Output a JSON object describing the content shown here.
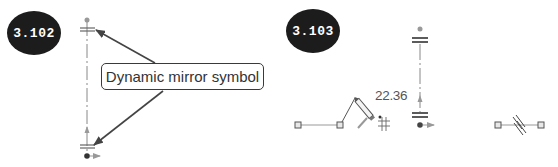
{
  "figures": [
    {
      "id": "left",
      "badge_label": "3.102",
      "callout_text": "Dynamic mirror symbol"
    },
    {
      "id": "right",
      "badge_label": "3.103",
      "dimension_value": "22.36"
    }
  ],
  "colors": {
    "badge_fill": "#1c1c1c",
    "badge_text": "#ffffff",
    "line": "#555555",
    "construction_line": "#9a9a9a",
    "arrow": "#444444"
  },
  "icons": [
    "mirror-symbol-icon",
    "pencil-cursor-icon",
    "grid-snap-icon",
    "endpoint-square-icon",
    "axis-arrow-icon"
  ]
}
